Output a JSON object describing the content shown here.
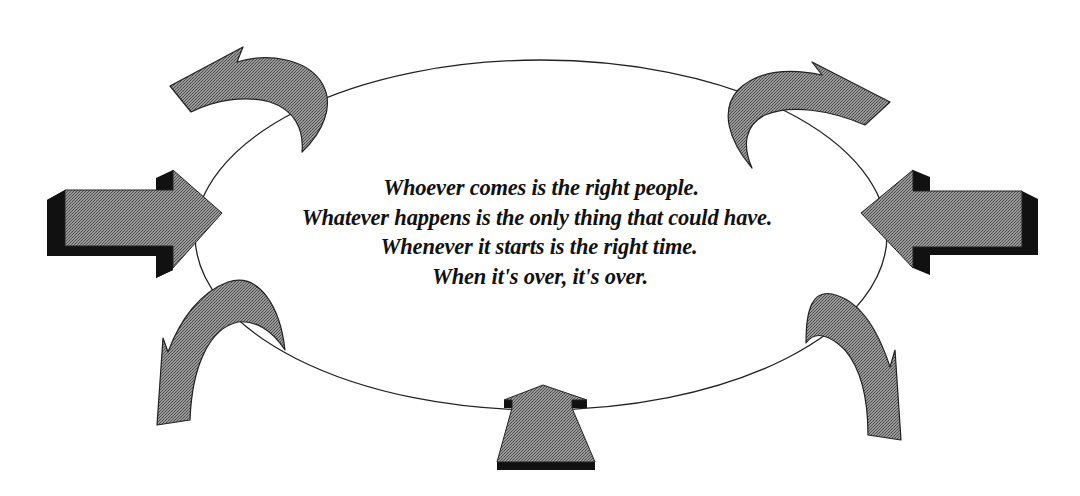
{
  "diagram": {
    "type": "cycle-with-arrows",
    "center_shape": "ellipse",
    "colors": {
      "background": "#ffffff",
      "arrow_fill": "#8a8a8a",
      "arrow_shadow": "#111111",
      "outline": "#222222",
      "text": "#111111"
    },
    "arrows": [
      {
        "id": "top-left",
        "style": "curved",
        "direction": "inward-down-right"
      },
      {
        "id": "top-right",
        "style": "curved",
        "direction": "inward-down-left"
      },
      {
        "id": "left",
        "style": "block-3d",
        "direction": "right"
      },
      {
        "id": "right",
        "style": "block-3d",
        "direction": "left"
      },
      {
        "id": "bottom-left",
        "style": "curved",
        "direction": "outward-down"
      },
      {
        "id": "bottom-right",
        "style": "curved",
        "direction": "outward-down"
      },
      {
        "id": "bottom",
        "style": "block-3d",
        "direction": "up"
      }
    ],
    "quote": {
      "lines": [
        "Whoever comes is the right people.",
        "Whatever happens is the only thing that could have.",
        "Whenever it starts is the right time.",
        "When it's over, it's over."
      ]
    }
  }
}
